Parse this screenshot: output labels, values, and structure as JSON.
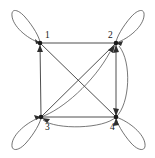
{
  "figure": {
    "type": "directed-graph",
    "width": 155,
    "height": 158,
    "background_color": "#ffffff",
    "edge_color": "#3b3b3b",
    "vertex_color": "#1a1a1a",
    "label_color": "#151515"
  },
  "graph_data": {
    "type": "directed-graph",
    "vertex_count": 4,
    "vertices": [
      {
        "id": "1",
        "label": "1",
        "x": 40,
        "y": 43,
        "label_x": 45,
        "label_y": 36
      },
      {
        "id": "2",
        "label": "2",
        "x": 116,
        "y": 43,
        "label_x": 110,
        "label_y": 36
      },
      {
        "id": "3",
        "label": "3",
        "x": 41,
        "y": 117,
        "label_x": 45,
        "label_y": 129
      },
      {
        "id": "4",
        "label": "4",
        "x": 116,
        "y": 117,
        "label_x": 111,
        "label_y": 129
      }
    ],
    "edges": [
      {
        "from": "2",
        "to": "1",
        "shape": "straight",
        "side": "top"
      },
      {
        "from": "1",
        "to": "3",
        "shape": "straight",
        "side": "left"
      },
      {
        "from": "3",
        "to": "4",
        "shape": "straight",
        "side": "bottom"
      },
      {
        "from": "4",
        "to": "2",
        "shape": "straight",
        "side": "right"
      },
      {
        "from": "3",
        "to": "2",
        "shape": "straight",
        "side": "diagonal"
      },
      {
        "from": "1",
        "to": "4",
        "shape": "straight",
        "side": "diagonal"
      },
      {
        "from": "3",
        "to": "2",
        "shape": "curved",
        "side": "diagonal-bowed"
      },
      {
        "from": "4",
        "to": "3",
        "shape": "curved",
        "side": "bottom-bowed"
      },
      {
        "from": "4",
        "to": "2",
        "shape": "curved",
        "side": "right-bowed"
      }
    ],
    "self_loops": [
      {
        "vertex": "1",
        "direction": "up-left"
      },
      {
        "vertex": "2",
        "direction": "up-right"
      },
      {
        "vertex": "3",
        "direction": "down-left"
      },
      {
        "vertex": "4",
        "direction": "down-right"
      }
    ]
  }
}
